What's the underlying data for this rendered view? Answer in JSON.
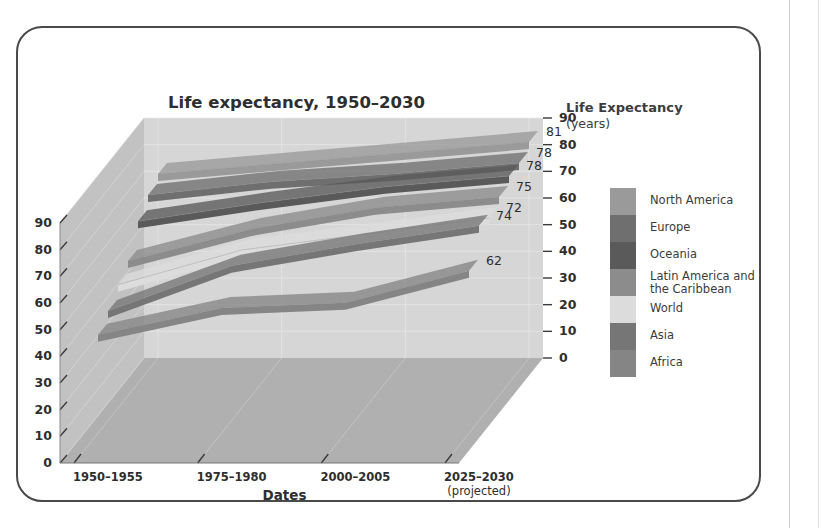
{
  "figure": {
    "title": "Life expectancy, 1950–2030",
    "x_axis_title": "Dates",
    "y_axis_header_bold": "Life Expectancy",
    "y_axis_header_unit": "(years)"
  },
  "colors": {
    "back_wall": "#d6d6d6",
    "side_wall": "#c2c2c2",
    "floor": "#b0b0b0",
    "frame_border": "#4a4a4a",
    "text": "#2e2e2e",
    "label_text": "#3b3b3b",
    "gridline": "#e8e8e8",
    "north_america": "#9a9a9a",
    "europe": "#6f6f6f",
    "oceania": "#5a5a5a",
    "latin_america": "#8c8c8c",
    "world": "#dcdcdc",
    "asia": "#767676",
    "africa": "#858585"
  },
  "legend": {
    "items": [
      {
        "label": "North America",
        "color": "#9a9a9a",
        "two_line": false
      },
      {
        "label": "Europe",
        "color": "#6f6f6f",
        "two_line": false
      },
      {
        "label": "Oceania",
        "color": "#5a5a5a",
        "two_line": false
      },
      {
        "label": "Latin America and\nthe Caribbean",
        "color": "#8c8c8c",
        "two_line": true
      },
      {
        "label": "World",
        "color": "#dcdcdc",
        "two_line": false
      },
      {
        "label": "Asia",
        "color": "#767676",
        "two_line": false
      },
      {
        "label": "Africa",
        "color": "#858585",
        "two_line": false
      }
    ]
  },
  "chart_data": {
    "type": "area",
    "title": "Life expectancy, 1950–2030",
    "xlabel": "Dates",
    "ylabel": "Life Expectancy (years)",
    "ylim": [
      0,
      90
    ],
    "y_ticks": [
      0,
      10,
      20,
      30,
      40,
      50,
      60,
      70,
      80,
      90
    ],
    "left_axis_ticks": [
      "0",
      "10",
      "20",
      "30",
      "40",
      "50",
      "60",
      "70",
      "80",
      "90"
    ],
    "right_axis_ticks": [
      "0",
      "10",
      "20",
      "30",
      "40",
      "50",
      "60",
      "70",
      "80",
      "90"
    ],
    "categories": [
      "1950–1955",
      "1975–1980",
      "2000–2005",
      "2025–2030"
    ],
    "category_notes": [
      "",
      "",
      "",
      "(projected)"
    ],
    "grid": true,
    "legend_position": "right",
    "series": [
      {
        "name": "North America",
        "color": "#9a9a9a",
        "values": [
          69,
          73,
          77,
          81
        ],
        "end_label": "81"
      },
      {
        "name": "Europe",
        "color": "#6f6f6f",
        "values": [
          66,
          71,
          74,
          78
        ],
        "end_label": "78"
      },
      {
        "name": "Oceania",
        "color": "#5a5a5a",
        "values": [
          61,
          68,
          74,
          78
        ],
        "end_label": "78"
      },
      {
        "name": "Latin America and the Caribbean",
        "color": "#8c8c8c",
        "values": [
          51,
          63,
          71,
          75
        ],
        "end_label": "75"
      },
      {
        "name": "World",
        "color": "#dcdcdc",
        "values": [
          47,
          60,
          66,
          72
        ],
        "end_label": "72"
      },
      {
        "name": "Asia",
        "color": "#767676",
        "values": [
          42,
          59,
          67,
          74
        ],
        "end_label": "74"
      },
      {
        "name": "Africa",
        "color": "#858585",
        "values": [
          38,
          48,
          50,
          62
        ],
        "end_label": "62"
      }
    ],
    "data_labels": [
      "81",
      "78",
      "78",
      "75",
      "72",
      "74",
      "62"
    ]
  }
}
